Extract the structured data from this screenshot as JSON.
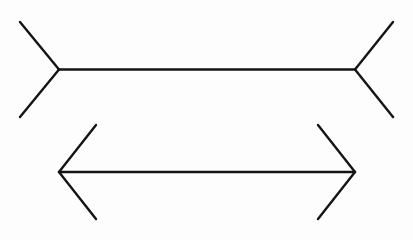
{
  "figure": {
    "name": "muller-lyer-illusion",
    "background_color": "#fdfdfd",
    "line_color": "#141414",
    "line_width": 2.4,
    "canvas": {
      "width": 413,
      "height": 240
    },
    "shapes": [
      {
        "id": "top-figure",
        "label": "outward-fins-figure",
        "fin_direction": "outward",
        "shaft": {
          "x1": 59,
          "y1": 69.5,
          "x2": 355,
          "y2": 69.5,
          "length": 296
        },
        "fins": [
          {
            "id": "top-left-upper-fin",
            "x1": 59,
            "y1": 69.5,
            "x2": 20,
            "y2": 22
          },
          {
            "id": "top-left-lower-fin",
            "x1": 59,
            "y1": 69.5,
            "x2": 20,
            "y2": 117
          },
          {
            "id": "top-right-upper-fin",
            "x1": 355,
            "y1": 69.5,
            "x2": 393,
            "y2": 22
          },
          {
            "id": "top-right-lower-fin",
            "x1": 355,
            "y1": 69.5,
            "x2": 393,
            "y2": 117
          }
        ]
      },
      {
        "id": "bottom-figure",
        "label": "inward-fins-figure",
        "fin_direction": "inward",
        "shaft": {
          "x1": 59,
          "y1": 172,
          "x2": 355,
          "y2": 172,
          "length": 296
        },
        "fins": [
          {
            "id": "bottom-left-upper-fin",
            "x1": 59,
            "y1": 172,
            "x2": 96,
            "y2": 125
          },
          {
            "id": "bottom-left-lower-fin",
            "x1": 59,
            "y1": 172,
            "x2": 96,
            "y2": 219
          },
          {
            "id": "bottom-right-upper-fin",
            "x1": 355,
            "y1": 172,
            "x2": 318,
            "y2": 125
          },
          {
            "id": "bottom-right-lower-fin",
            "x1": 355,
            "y1": 172,
            "x2": 318,
            "y2": 219
          }
        ]
      }
    ]
  }
}
